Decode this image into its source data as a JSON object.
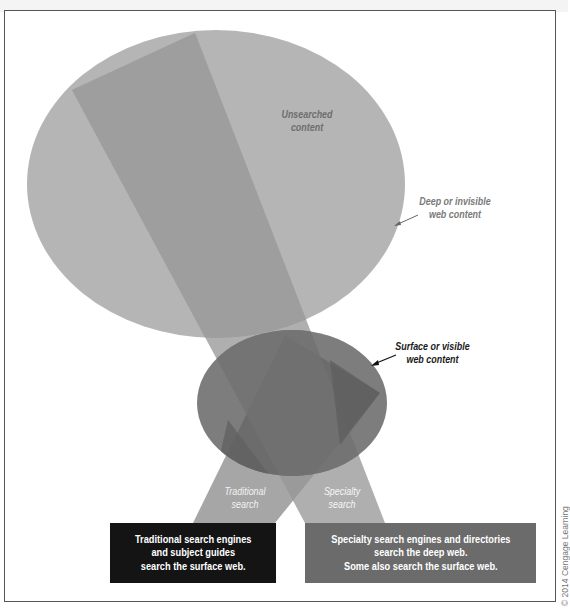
{
  "diagram": {
    "labels": {
      "unsearched_line1": "Unsearched",
      "unsearched_line2": "content",
      "deep_line1": "Deep or invisible",
      "deep_line2": "web content",
      "surface_line1": "Surface or visible",
      "surface_line2": "web content",
      "traditional_line1": "Traditional",
      "traditional_line2": "search",
      "specialty_line1": "Specialty",
      "specialty_line2": "search"
    },
    "boxes": {
      "traditional": {
        "line1": "Traditional search engines",
        "line2": "and subject guides",
        "line3": "search the surface web."
      },
      "specialty": {
        "line1": "Specialty search engines and directories",
        "line2": "search the deep web.",
        "line3": "Some also search the surface web."
      }
    },
    "copyright": "© 2014 Cengage Learning",
    "colors": {
      "deep_web_ellipse": "#b4b4b4",
      "surface_web_ellipse": "#7c7c7c",
      "specialty_beam": "#a0a0a0",
      "traditional_beam": "#8e8e8e",
      "traditional_box": "#141414",
      "specialty_box": "#6b6b6b"
    }
  }
}
